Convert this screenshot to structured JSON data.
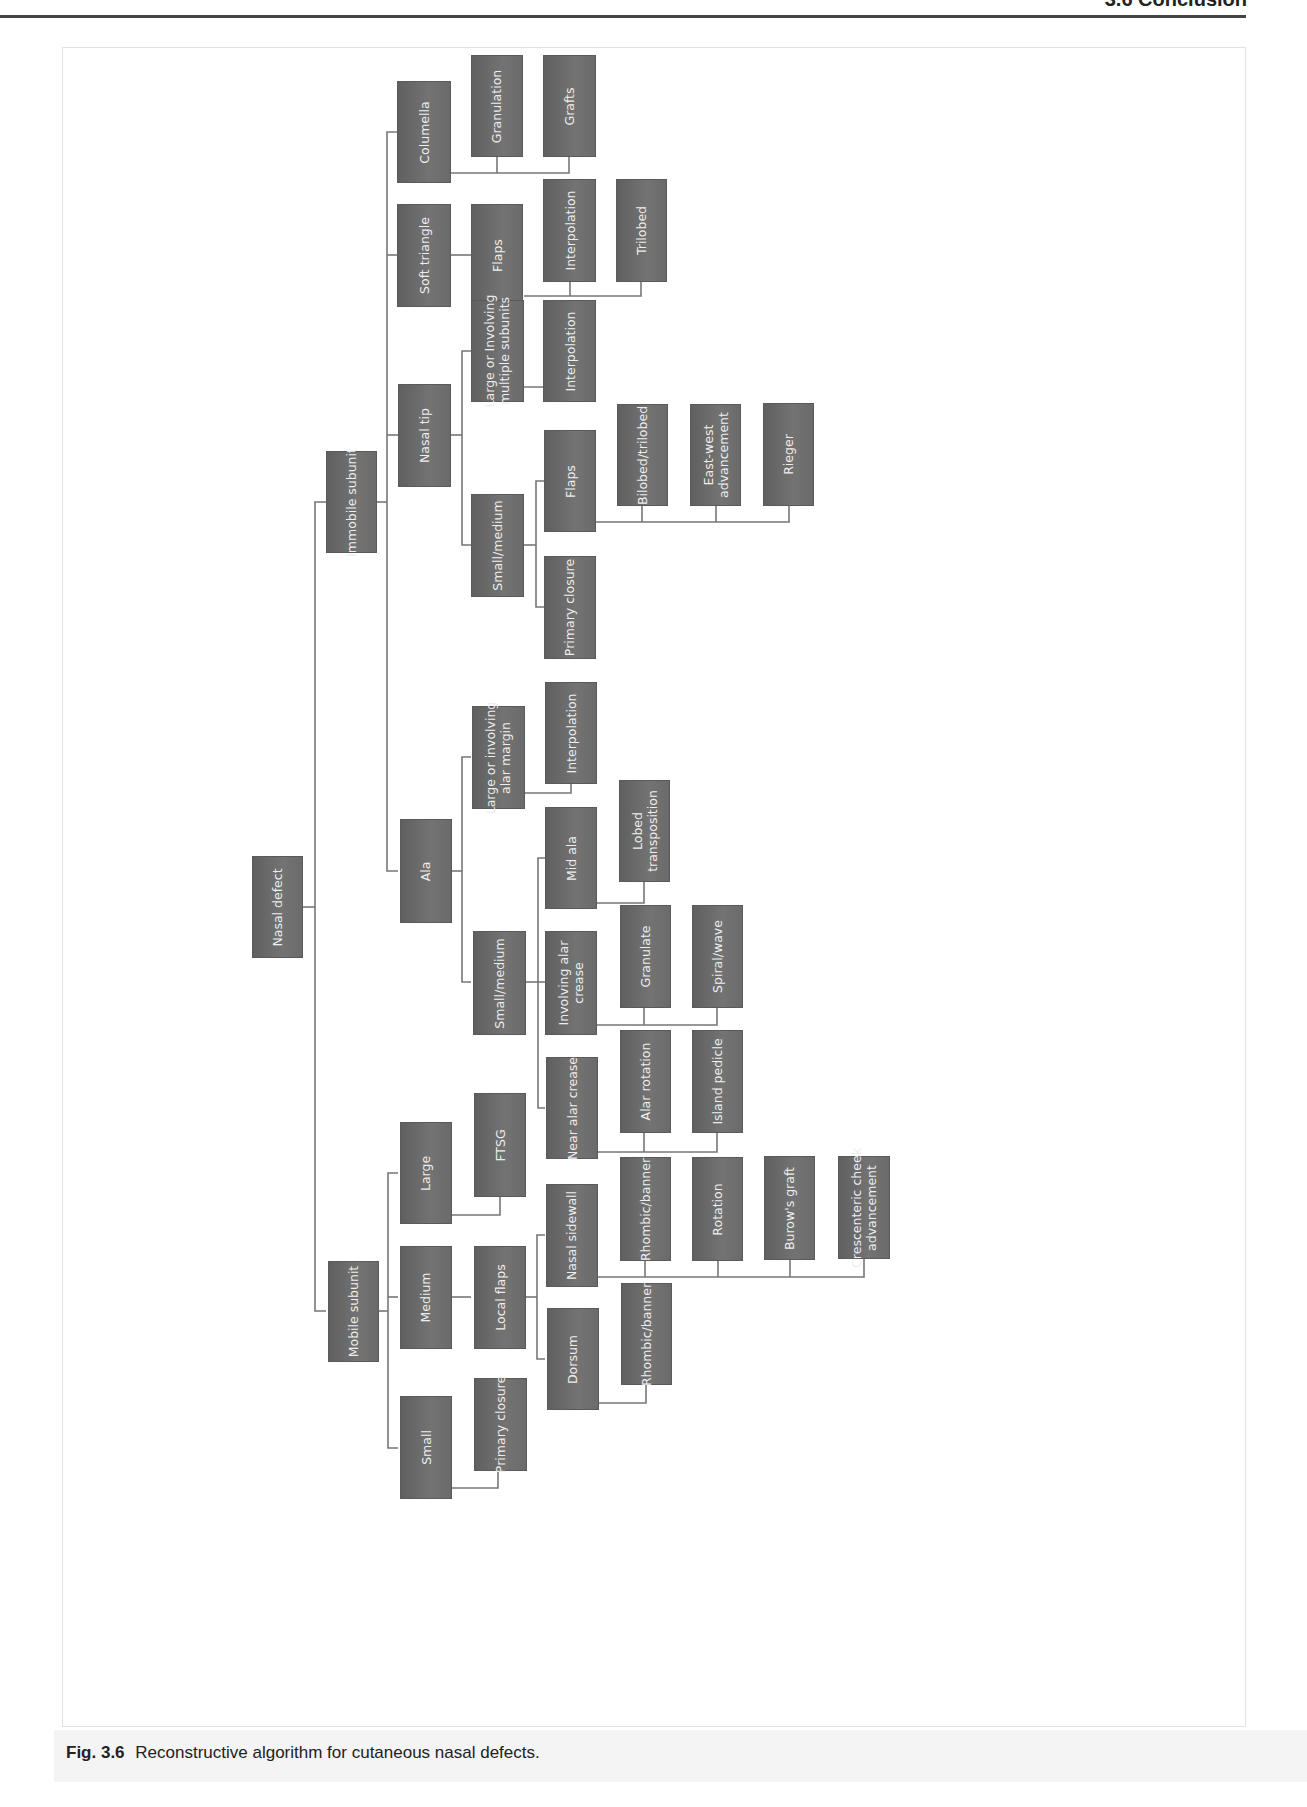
{
  "page": {
    "running_head": "3.6  Conclusion",
    "caption_number": "Fig. 3.6",
    "caption_text": "Reconstructive algorithm for cutaneous nasal defects."
  },
  "style": {
    "node_color": "#6a6a6a",
    "node_text_color": "#eeeeee",
    "connector_color": "#777777"
  },
  "nodes": {
    "nasal_defect": "Nasal defect",
    "immobile_subunit": "Immobile subunit",
    "mobile_subunit": "Mobile subunit",
    "columella": "Columella",
    "soft_triangle": "Soft triangle",
    "nasal_tip": "Nasal tip",
    "ala": "Ala",
    "large": "Large",
    "medium": "Medium",
    "small": "Small",
    "granulation": "Granulation",
    "grafts": "Grafts",
    "st_flaps": "Flaps",
    "st_interpolation": "Interpolation",
    "trilobed": "Trilobed",
    "tip_large": "Large or Involving\nmultiple subunits",
    "tip_large_interpolation": "Interpolation",
    "tip_small_medium": "Small/medium",
    "tip_flaps": "Flaps",
    "tip_primary_closure": "Primary closure",
    "bilobed_trilobed": "Bilobed/trilobed",
    "east_west": "East-west\nadvancement",
    "rieger": "Rieger",
    "ala_large": "Large or involving\nalar margin",
    "ala_large_interpolation": "Interpolation",
    "ala_small_medium": "Small/medium",
    "mid_ala": "Mid ala",
    "lobed_transposition": "Lobed\ntransposition",
    "involving_alar_crease": "Involving alar\ncrease",
    "granulate": "Granulate",
    "spiral_wave": "Spiral/wave",
    "near_alar_crease": "Near alar crease",
    "alar_rotation": "Alar rotation",
    "island_pedicle": "Island pedicle",
    "ftsg": "FTSG",
    "local_flaps": "Local flaps",
    "nasal_sidewall": "Nasal sidewall",
    "sw_rhombic": "Rhombic/banner",
    "sw_rotation": "Rotation",
    "burows_graft": "Burow's graft",
    "crescenteric": "Crescenteric cheek\nadvancement",
    "dorsum": "Dorsum",
    "dorsum_rhombic": "Rhombic/banner",
    "small_primary_closure": "Primary closure"
  },
  "tree": {
    "label": "Nasal defect",
    "children": [
      {
        "label": "Immobile subunit",
        "children": [
          {
            "label": "Columella",
            "children": [
              {
                "label": "Granulation"
              },
              {
                "label": "Grafts"
              }
            ]
          },
          {
            "label": "Soft triangle",
            "children": [
              {
                "label": "Flaps",
                "children": [
                  {
                    "label": "Interpolation"
                  },
                  {
                    "label": "Trilobed"
                  }
                ]
              }
            ]
          },
          {
            "label": "Nasal tip",
            "children": [
              {
                "label": "Large or Involving multiple subunits",
                "children": [
                  {
                    "label": "Interpolation"
                  }
                ]
              },
              {
                "label": "Small/medium",
                "children": [
                  {
                    "label": "Flaps",
                    "children": [
                      {
                        "label": "Bilobed/trilobed"
                      },
                      {
                        "label": "East-west advancement"
                      },
                      {
                        "label": "Rieger"
                      }
                    ]
                  },
                  {
                    "label": "Primary closure"
                  }
                ]
              }
            ]
          },
          {
            "label": "Ala",
            "children": [
              {
                "label": "Large or involving alar margin",
                "children": [
                  {
                    "label": "Interpolation"
                  }
                ]
              },
              {
                "label": "Small/medium",
                "children": [
                  {
                    "label": "Mid ala",
                    "children": [
                      {
                        "label": "Lobed transposition"
                      }
                    ]
                  },
                  {
                    "label": "Involving alar crease",
                    "children": [
                      {
                        "label": "Granulate"
                      },
                      {
                        "label": "Spiral/wave"
                      }
                    ]
                  },
                  {
                    "label": "Near alar crease",
                    "children": [
                      {
                        "label": "Alar rotation"
                      },
                      {
                        "label": "Island pedicle"
                      }
                    ]
                  }
                ]
              }
            ]
          }
        ]
      },
      {
        "label": "Mobile subunit",
        "children": [
          {
            "label": "Large",
            "children": [
              {
                "label": "FTSG"
              }
            ]
          },
          {
            "label": "Medium",
            "children": [
              {
                "label": "Local flaps",
                "children": [
                  {
                    "label": "Nasal sidewall",
                    "children": [
                      {
                        "label": "Rhombic/banner"
                      },
                      {
                        "label": "Rotation"
                      },
                      {
                        "label": "Burow's graft"
                      },
                      {
                        "label": "Crescenteric cheek advancement"
                      }
                    ]
                  },
                  {
                    "label": "Dorsum",
                    "children": [
                      {
                        "label": "Rhombic/banner"
                      }
                    ]
                  }
                ]
              }
            ]
          },
          {
            "label": "Small",
            "children": [
              {
                "label": "Primary closure"
              }
            ]
          }
        ]
      }
    ]
  }
}
